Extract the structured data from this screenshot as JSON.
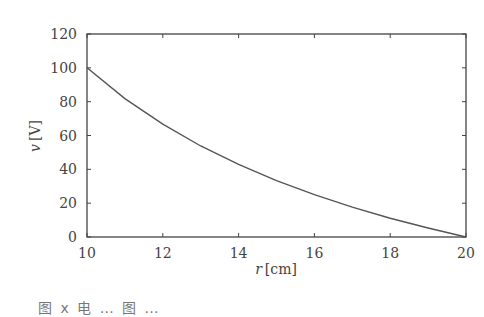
{
  "chart_data": {
    "type": "line",
    "title": "",
    "xlabel": "r [cm]",
    "ylabel": "v [V]",
    "xlabel_var": "r",
    "xlabel_unit": "[cm]",
    "ylabel_var": "v",
    "ylabel_unit": "[V]",
    "xlim": [
      10,
      20
    ],
    "ylim": [
      0,
      120
    ],
    "xticks": [
      10,
      12,
      14,
      16,
      18,
      20
    ],
    "yticks": [
      0,
      20,
      40,
      60,
      80,
      100,
      120
    ],
    "grid": false,
    "legend": null,
    "series": [
      {
        "name": "v(r)",
        "x": [
          10,
          11,
          12,
          13,
          14,
          15,
          16,
          17,
          18,
          19,
          20
        ],
        "y": [
          100,
          81.8,
          66.7,
          53.8,
          42.9,
          33.3,
          25.0,
          17.6,
          11.1,
          5.3,
          0
        ]
      }
    ]
  },
  "caption": "图 x 电 … 图 …",
  "colors": {
    "line": "#555555",
    "axis": "#444444",
    "text": "#444444"
  }
}
